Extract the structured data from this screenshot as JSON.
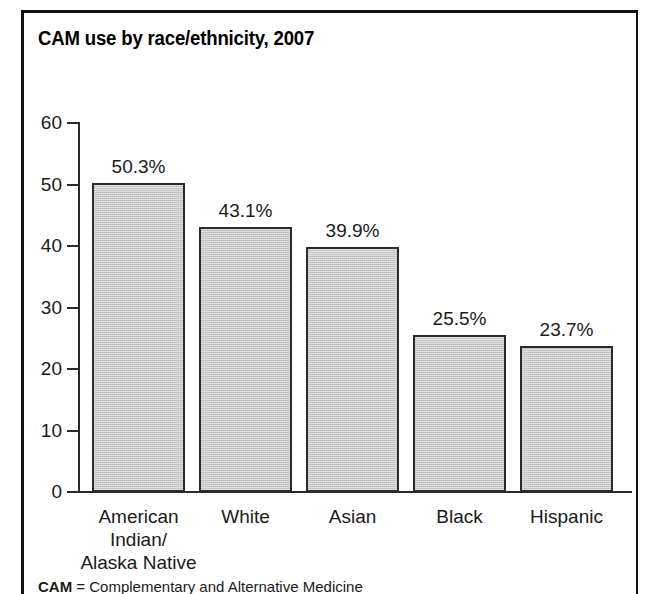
{
  "figure": {
    "title": "CAM use by race/ethnicity, 2007",
    "footnote_abbr": "CAM",
    "footnote_text": " = Complementary and Alternative Medicine",
    "frame_color": "#111111",
    "bar_fill": "#c9c9c9",
    "bar_stroke": "#2b2b2b",
    "axis_color": "#2a2a2a"
  },
  "chart_data": {
    "type": "bar",
    "title": "CAM use by race/ethnicity, 2007",
    "xlabel": "",
    "ylabel": "",
    "categories": [
      "American Indian/ Alaska Native",
      "White",
      "Asian",
      "Black",
      "Hispanic"
    ],
    "category_lines": [
      [
        "American",
        "Indian/",
        "Alaska Native"
      ],
      [
        "White"
      ],
      [
        "Asian"
      ],
      [
        "Black"
      ],
      [
        "Hispanic"
      ]
    ],
    "values": [
      50.3,
      43.1,
      39.9,
      25.5,
      23.7
    ],
    "value_labels": [
      "50.3%",
      "43.1%",
      "39.9%",
      "25.5%",
      "23.7%"
    ],
    "ylim": [
      0,
      60
    ],
    "yticks": [
      0,
      10,
      20,
      30,
      40,
      50,
      60
    ],
    "ytick_labels": [
      "0",
      "10",
      "20",
      "30",
      "40",
      "50",
      "60"
    ],
    "grid": false,
    "legend": "none"
  }
}
